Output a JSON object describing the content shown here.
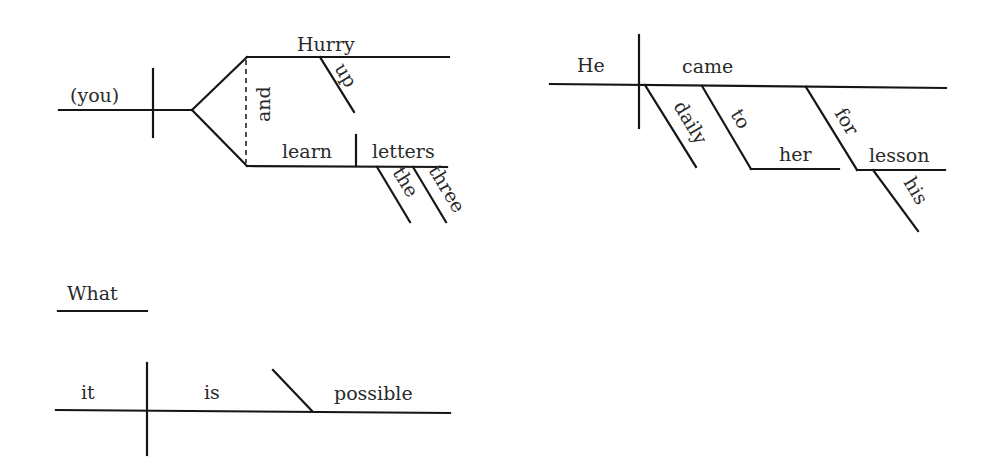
{
  "diagrams": [
    {
      "sentence": "Hurry up and learn the three letters.",
      "subject": "(you)",
      "verbs": [
        "Hurry",
        "learn"
      ],
      "conjunction": "and",
      "modifiers": {
        "up": "up",
        "the": "the",
        "three": "three"
      },
      "object": "letters"
    },
    {
      "sentence": "He came daily to her for his lesson.",
      "subject": "He",
      "verb": "came",
      "adverb": "daily",
      "prepositions": [
        {
          "prep": "to",
          "object": "her"
        },
        {
          "prep": "for",
          "object": "lesson",
          "modifier": "his"
        }
      ]
    },
    {
      "sentence": "What it is possible",
      "noun_clause_word": "What",
      "subject": "it",
      "verb": "is",
      "complement": "possible"
    }
  ],
  "colors": {
    "line": "#151515",
    "text": "#2a2a2a",
    "background": "#ffffff"
  }
}
